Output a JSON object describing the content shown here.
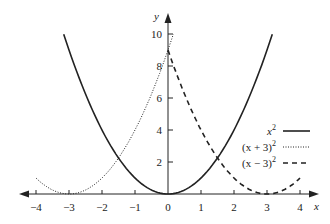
{
  "chart_data": {
    "type": "line",
    "title": "",
    "xlabel": "x",
    "ylabel": "y",
    "xlim": [
      -4,
      4
    ],
    "ylim": [
      0,
      10
    ],
    "x_ticks": [
      "−4",
      "−3",
      "−2",
      "−1",
      "0",
      "1",
      "2",
      "3",
      "4"
    ],
    "y_ticks": [
      "2",
      "4",
      "6",
      "8",
      "10"
    ],
    "grid": false,
    "legend_position": "lower right",
    "series": [
      {
        "name": "x²",
        "style": "solid",
        "expr": "x^2",
        "x_range": [
          -3.16,
          3.16
        ]
      },
      {
        "name": "(x + 3)²",
        "style": "dotted",
        "expr": "(x+3)^2",
        "x_range": [
          -4,
          0.16
        ]
      },
      {
        "name": "(x − 3)²",
        "style": "dashed",
        "expr": "(x-3)^2",
        "x_range": [
          0,
          4
        ]
      }
    ]
  },
  "legend": {
    "items": [
      {
        "label_base": "x",
        "label_pre": "",
        "label_post": "",
        "sup": "2"
      },
      {
        "label_base": "(x + 3)",
        "sup": "2"
      },
      {
        "label_base": "(x − 3)",
        "sup": "2"
      }
    ]
  },
  "axes": {
    "x_name": "x",
    "y_name": "y"
  }
}
